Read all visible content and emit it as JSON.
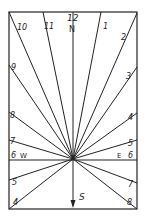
{
  "diagram": {
    "colors": {
      "ink": "#222222",
      "paper": "#ffffff"
    },
    "frame": {
      "x1": 9,
      "y1": 12,
      "x2": 137,
      "y2": 209
    },
    "center": {
      "x": 73,
      "y": 159
    },
    "hour_lines": [
      {
        "hour": "10",
        "x": 9,
        "y": 12,
        "lx": 17,
        "ly": 23
      },
      {
        "hour": "11",
        "x": 43,
        "y": 12,
        "lx": 44,
        "ly": 22
      },
      {
        "hour": "1",
        "x": 101,
        "y": 12,
        "lx": 103,
        "ly": 22
      },
      {
        "hour": "2",
        "x": 137,
        "y": 13,
        "lx": 121,
        "ly": 33
      },
      {
        "hour": "9",
        "x": 9,
        "y": 65,
        "lx": 11,
        "ly": 63
      },
      {
        "hour": "3",
        "x": 137,
        "y": 67,
        "lx": 126,
        "ly": 72
      },
      {
        "hour": "8",
        "x": 9,
        "y": 112,
        "lx": 10,
        "ly": 111
      },
      {
        "hour": "4",
        "x": 137,
        "y": 113,
        "lx": 128,
        "ly": 113
      },
      {
        "hour": "7",
        "x": 9,
        "y": 140,
        "lx": 10,
        "ly": 137
      },
      {
        "hour": "5",
        "x": 137,
        "y": 140,
        "lx": 128,
        "ly": 139
      },
      {
        "hour": "5",
        "x": 9,
        "y": 180,
        "lx": 12,
        "ly": 178
      },
      {
        "hour": "7",
        "x": 137,
        "y": 183,
        "lx": 128,
        "ly": 180
      },
      {
        "hour": "4",
        "x": 9,
        "y": 209,
        "lx": 13,
        "ly": 198
      },
      {
        "hour": "8",
        "x": 137,
        "y": 209,
        "lx": 127,
        "ly": 198
      }
    ],
    "labels": {
      "noon": "12",
      "north": "N",
      "south": "S",
      "west_six": "6",
      "west": "W",
      "east": "E",
      "east_six": "6"
    }
  }
}
